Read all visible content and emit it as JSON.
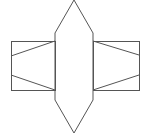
{
  "diagram": {
    "type": "geometric-net",
    "stroke_color": "#555555",
    "background": "#ffffff",
    "center_hexagon": {
      "points": [
        [
          74,
          0
        ],
        [
          93,
          33
        ],
        [
          93,
          100
        ],
        [
          74,
          133
        ],
        [
          55,
          100
        ],
        [
          55,
          33
        ]
      ]
    },
    "left_rect": {
      "x": 11,
      "y": 41,
      "width": 44,
      "height": 49
    },
    "right_rect": {
      "x": 93,
      "y": 41,
      "width": 46,
      "height": 49
    },
    "left_diagonals": [
      {
        "x1": 55,
        "y1": 41,
        "x2": 11,
        "y2": 56
      },
      {
        "x1": 11,
        "y1": 75,
        "x2": 55,
        "y2": 90
      }
    ],
    "right_diagonals": [
      {
        "x1": 93,
        "y1": 41,
        "x2": 139,
        "y2": 55
      },
      {
        "x1": 139,
        "y1": 75,
        "x2": 93,
        "y2": 90
      }
    ]
  }
}
